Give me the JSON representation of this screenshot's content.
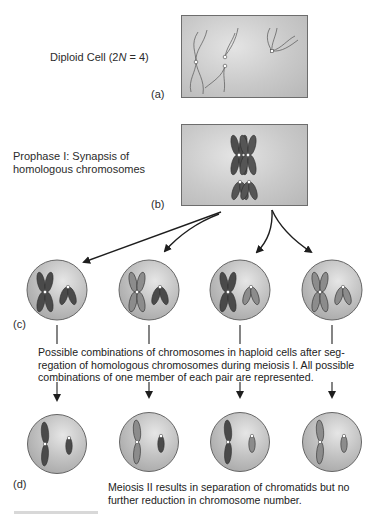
{
  "figure": {
    "panel_a": {
      "tag": "(a)",
      "label_prefix": "Diploid Cell (2",
      "label_italic": "N",
      "label_suffix": " = 4)"
    },
    "panel_b": {
      "tag": "(b)",
      "label_line1": "Prophase I: Synapsis of",
      "label_line2": "homologous chromosomes"
    },
    "panel_c": {
      "tag": "(c)",
      "caption_line1": "Possible combinations of chromosomes in haploid cells after seg-",
      "caption_line2": "regation of homologous chromosomes during meiosis I. All possible",
      "caption_line3": "combinations of one member of each pair are represented.",
      "cells": [
        {
          "large_pair": "dark",
          "small_pair": "dark"
        },
        {
          "large_pair": "light",
          "small_pair": "dark"
        },
        {
          "large_pair": "dark",
          "small_pair": "light"
        },
        {
          "large_pair": "light",
          "small_pair": "light"
        }
      ]
    },
    "panel_d": {
      "tag": "(d)",
      "caption_line1": "Meiosis II results in separation of chromatids but no",
      "caption_line2": "further reduction in chromosome number.",
      "cells": [
        {
          "large": "dark",
          "small": "dark"
        },
        {
          "large": "light",
          "small": "dark"
        },
        {
          "large": "dark",
          "small": "light"
        },
        {
          "large": "light",
          "small": "light"
        }
      ]
    },
    "colors": {
      "cell_fill": "#bdbdbd",
      "cell_stroke": "#666666",
      "chromosome_dark": "#4a4a4a",
      "chromosome_light": "#8c8c8c",
      "arrow": "#1e1e1e",
      "centromere": "#ffffff"
    },
    "icons": [
      "arrow-icon",
      "chromosome-icon",
      "centromere-icon"
    ]
  }
}
